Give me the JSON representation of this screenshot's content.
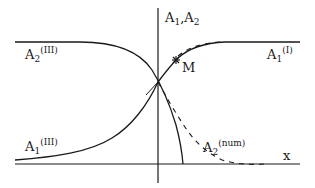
{
  "diagram": {
    "axis_labels": {
      "y_axis_base": "A",
      "y_axis_sub1": "1",
      "y_axis_sep": ",A",
      "y_axis_sub2": "2",
      "x_axis": "x"
    },
    "curves": {
      "a2_iii": {
        "base": "A",
        "sub": "2",
        "sup": "(III)"
      },
      "a1_i": {
        "base": "A",
        "sub": "1",
        "sup": "(I)"
      },
      "a1_iii": {
        "base": "A",
        "sub": "1",
        "sup": "(III)"
      },
      "a2_num": {
        "base": "A",
        "sub": "2",
        "sup": "(num)"
      }
    },
    "point_label": "M",
    "colors": {
      "ink": "#1a1a1a",
      "background": "#ffffff"
    }
  }
}
